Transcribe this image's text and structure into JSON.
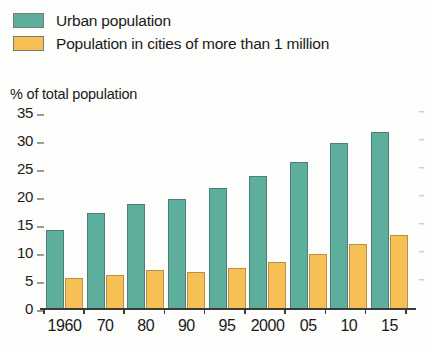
{
  "legend": {
    "items": [
      {
        "label": "Urban population",
        "color": "#5eae9e",
        "key": "urban"
      },
      {
        "label": "Population in cities of more than 1 million",
        "color": "#f7c055",
        "key": "million_plus"
      }
    ]
  },
  "axis_title": "% of total population",
  "chart_data": {
    "type": "bar",
    "title": "",
    "subtitle": "",
    "xlabel": "",
    "ylabel": "% of total population",
    "ylim": [
      0,
      35
    ],
    "yticks": [
      0,
      5,
      10,
      15,
      20,
      25,
      30,
      35
    ],
    "ytick_labels": [
      "0",
      "5",
      "10",
      "15",
      "20",
      "25",
      "30",
      "35"
    ],
    "grid": false,
    "legend_position": "top-left",
    "categories": [
      "1960",
      "70",
      "80",
      "90",
      "95",
      "2000",
      "05",
      "10",
      "15"
    ],
    "series": [
      {
        "name": "Urban population",
        "color": "#5eae9e",
        "values": [
          14,
          17,
          18.5,
          19.5,
          21.5,
          23.5,
          26,
          29.5,
          31.5
        ]
      },
      {
        "name": "Population in cities of more than 1 million",
        "color": "#f7c055",
        "values": [
          5.3,
          5.9,
          6.7,
          6.4,
          7.2,
          8.3,
          9.6,
          11.5,
          13
        ]
      }
    ]
  }
}
